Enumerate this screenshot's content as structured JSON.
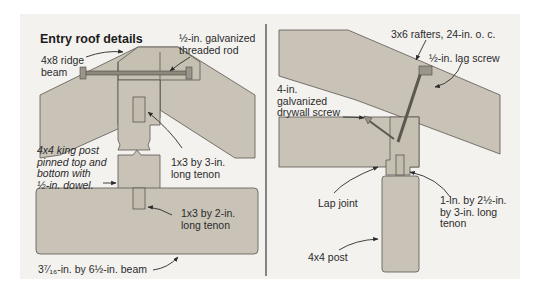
{
  "left_panel": {
    "title": "Entry roof details",
    "labels": {
      "ridge_beam": "4x8 ridge\nbeam",
      "threaded_rod": "½-in. galvanized\nthreaded rod",
      "king_post": "4x4 king post\npinned top and\nbottom with\n½-in. dowel.",
      "tenon_top": "1x3 by 3-in.\nlong tenon",
      "tenon_bottom": "1x3 by 2-in.\nlong tenon",
      "beam": "3⁷⁄₁₆-in. by 6½-in. beam"
    }
  },
  "right_panel": {
    "labels": {
      "rafters": "3x6 rafters, 24-in. o. c.",
      "lag_screw": "½-in. lag screw",
      "drywall_screw": "4-in.\ngalvanized\ndrywall screw",
      "lap_joint": "Lap joint",
      "post_tenon": "1-in. by 2½-in.\nby 3-in. long\ntenon",
      "post": "4x4 post"
    }
  },
  "colors": {
    "background": "#f3f2ef",
    "wood": "#c9c3b7",
    "wood_dark": "#b9b2a5",
    "outline": "#5a5650",
    "text": "#2b2b2b",
    "divider": "#3a3a3a"
  }
}
